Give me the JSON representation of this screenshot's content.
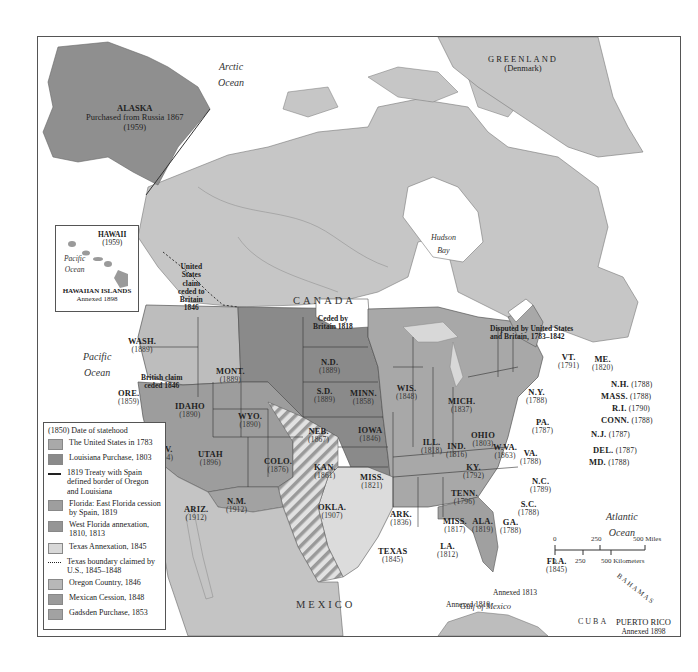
{
  "map": {
    "oceans": {
      "arctic": [
        "Arctic",
        "Ocean"
      ],
      "pacific_hawaii": [
        "Pacific",
        "Ocean"
      ],
      "pacific": [
        "Pacific",
        "Ocean"
      ],
      "atlantic": [
        "Atlantic",
        "Ocean"
      ],
      "hudson_bay": [
        "Hudson",
        "Bay"
      ],
      "gulf": "Gulf of Mexico"
    },
    "countries": {
      "canada": "CANADA",
      "mexico": "MEXICO",
      "cuba": "CUBA",
      "bahamas": "BAHAMAS",
      "greenland": {
        "name": "GREENLAND",
        "sub": "(Denmark)"
      }
    },
    "alaska": {
      "name": "ALASKA",
      "note": "Purchased from Russia 1867",
      "year": "(1959)"
    },
    "hawaii_inset": {
      "name": "HAWAII",
      "year": "(1959)",
      "ocean": [
        "Pacific",
        "Ocean"
      ],
      "islands": "HAWAIIAN ISLANDS",
      "annexed": "Annexed 1898"
    },
    "puerto_rico": {
      "name": "PUERTO RICO",
      "annexed": "Annexed 1898"
    },
    "notes": {
      "us_claim_ceded": [
        "United",
        "States",
        "claim",
        "ceded to",
        "Britain",
        "1846"
      ],
      "british_claim": [
        "British claim",
        "ceded 1846"
      ],
      "ceded_1818": [
        "Ceded by",
        "Britain 1818"
      ],
      "disputed": [
        "Disputed by United States",
        "and Britain, 1783–1842"
      ],
      "annexed_1810": "Annexed 1810",
      "annexed_1813": "Annexed 1813"
    },
    "states": [
      {
        "id": "wash",
        "name": "WASH.",
        "year": "(1889)"
      },
      {
        "id": "ore",
        "name": "ORE.",
        "year": "(1859)"
      },
      {
        "id": "calif",
        "name": "CALIF.",
        "year": "(1850)"
      },
      {
        "id": "nev",
        "name": "NEV.",
        "year": "(1864)"
      },
      {
        "id": "idaho",
        "name": "IDAHO",
        "year": "(1890)"
      },
      {
        "id": "mont",
        "name": "MONT.",
        "year": "(1889)"
      },
      {
        "id": "wyo",
        "name": "WYO.",
        "year": "(1890)"
      },
      {
        "id": "utah",
        "name": "UTAH",
        "year": "(1896)"
      },
      {
        "id": "colo",
        "name": "COLO.",
        "year": "(1876)"
      },
      {
        "id": "ariz",
        "name": "ARIZ.",
        "year": "(1912)"
      },
      {
        "id": "nm",
        "name": "N.M.",
        "year": "(1912)"
      },
      {
        "id": "nd",
        "name": "N.D.",
        "year": "(1889)"
      },
      {
        "id": "sd",
        "name": "S.D.",
        "year": "(1889)"
      },
      {
        "id": "neb",
        "name": "NEB.",
        "year": "(1867)"
      },
      {
        "id": "kan",
        "name": "KAN.",
        "year": "(1861)"
      },
      {
        "id": "okla",
        "name": "OKLA.",
        "year": "(1907)"
      },
      {
        "id": "texas",
        "name": "TEXAS",
        "year": "(1845)"
      },
      {
        "id": "minn",
        "name": "MINN.",
        "year": "(1858)"
      },
      {
        "id": "iowa",
        "name": "IOWA",
        "year": "(1846)"
      },
      {
        "id": "miss_mo",
        "name": "MISS.",
        "year": "(1821)"
      },
      {
        "id": "ark",
        "name": "ARK.",
        "year": "(1836)"
      },
      {
        "id": "la",
        "name": "LA.",
        "year": "(1812)"
      },
      {
        "id": "wis",
        "name": "WIS.",
        "year": "(1848)"
      },
      {
        "id": "ill",
        "name": "ILL.",
        "year": "(1818)"
      },
      {
        "id": "mich",
        "name": "MICH.",
        "year": "(1837)"
      },
      {
        "id": "ind",
        "name": "IND.",
        "year": "(1816)"
      },
      {
        "id": "ohio",
        "name": "OHIO",
        "year": "(1803)"
      },
      {
        "id": "ky",
        "name": "KY.",
        "year": "(1792)"
      },
      {
        "id": "tenn",
        "name": "TENN.",
        "year": "(1796)"
      },
      {
        "id": "miss",
        "name": "MISS.",
        "year": "(1817)"
      },
      {
        "id": "ala",
        "name": "ALA.",
        "year": "(1819)"
      },
      {
        "id": "ga",
        "name": "GA.",
        "year": "(1788)"
      },
      {
        "id": "fla",
        "name": "FLA.",
        "year": "(1845)"
      },
      {
        "id": "sc",
        "name": "S.C.",
        "year": "(1788)"
      },
      {
        "id": "nc",
        "name": "N.C.",
        "year": "(1789)"
      },
      {
        "id": "va",
        "name": "VA.",
        "year": "(1788)"
      },
      {
        "id": "wva",
        "name": "W.VA.",
        "year": "(1863)"
      },
      {
        "id": "pa",
        "name": "PA.",
        "year": "(1787)"
      },
      {
        "id": "ny",
        "name": "N.Y.",
        "year": "(1788)"
      },
      {
        "id": "vt",
        "name": "VT.",
        "year": "(1791)"
      },
      {
        "id": "me",
        "name": "ME.",
        "year": "(1820)"
      },
      {
        "id": "nh",
        "name": "N.H.",
        "year": "(1788)"
      },
      {
        "id": "mass",
        "name": "MASS.",
        "year": "(1788)"
      },
      {
        "id": "ri",
        "name": "R.I.",
        "year": "(1790)"
      },
      {
        "id": "conn",
        "name": "CONN.",
        "year": "(1788)"
      },
      {
        "id": "nj",
        "name": "N.J.",
        "year": "(1787)"
      },
      {
        "id": "del",
        "name": "DEL.",
        "year": "(1787)"
      },
      {
        "id": "md",
        "name": "MD.",
        "year": "(1788)"
      }
    ]
  },
  "legend": {
    "header": "(1850)  Date of statehood",
    "items": [
      {
        "type": "swatch",
        "color": "#a9a9a9",
        "label": "The United States in 1783"
      },
      {
        "type": "swatch",
        "color": "#8a8a8a",
        "label": "Louisiana Purchase, 1803"
      },
      {
        "type": "line",
        "style": "solid",
        "label": "1819 Treaty with Spain defined border of Oregon and Louisiana"
      },
      {
        "type": "swatch",
        "color": "#9e9e9e",
        "label": "Florida: East Florida cession by Spain, 1819"
      },
      {
        "type": "swatch",
        "color": "#959595",
        "label": "West Florida annexation, 1810, 1813"
      },
      {
        "type": "swatch",
        "color": "#d8d8d8",
        "label": "Texas Annexation, 1845"
      },
      {
        "type": "line",
        "style": "dotted",
        "label": "Texas boundary claimed by U.S., 1845–1848"
      },
      {
        "type": "swatch",
        "color": "#b8b8b8",
        "label": "Oregon Country, 1846"
      },
      {
        "type": "swatch",
        "color": "#9a9a9a",
        "label": "Mexican Cession, 1848"
      },
      {
        "type": "swatch",
        "color": "#a2a2a2",
        "label": "Gadsden Purchase, 1853"
      }
    ]
  },
  "scale": {
    "miles": [
      "0",
      "250",
      "500 Miles"
    ],
    "km": [
      "0",
      "250",
      "500 Kilometers"
    ]
  },
  "colors": {
    "canada": "#c6c6c6",
    "alaska": "#8f8f8f",
    "original_us": "#a8a8a8",
    "louisiana": "#8a8a8a",
    "oregon": "#bdbdbd",
    "mexican_cession": "#9d9d9d",
    "texas": "#dcdcdc",
    "mexico": "#c4c4c4",
    "water": "#ffffff"
  }
}
